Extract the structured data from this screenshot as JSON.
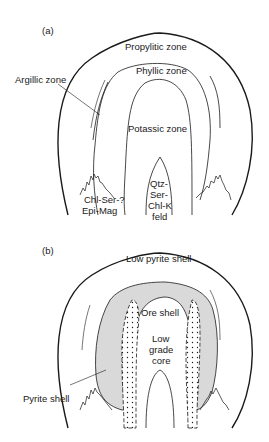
{
  "figure": {
    "panel_a": {
      "label": "(a)",
      "zones": {
        "propylitic": "Propylitic zone",
        "phyllic": "Phyllic zone",
        "argillic": "Argillic zone",
        "potassic": "Potassic zone",
        "core_line1": "Qtz-",
        "core_line2": "Ser-",
        "core_line3": "Chl-K",
        "core_line4": "feld",
        "chl_line1": "Chl-Ser-?",
        "chl_line2": "Epi-Mag"
      }
    },
    "panel_b": {
      "label": "(b)",
      "zones": {
        "low_pyrite": "Low pyrite shell",
        "ore_shell": "Ore shell",
        "core_line1": "Low",
        "core_line2": "grade",
        "core_line3": "core",
        "pyrite_shell": "Pyrite shell"
      }
    },
    "colors": {
      "line": "#1a1a1a",
      "pyrite_fill": "#d9d9d9",
      "background": "#ffffff"
    }
  }
}
